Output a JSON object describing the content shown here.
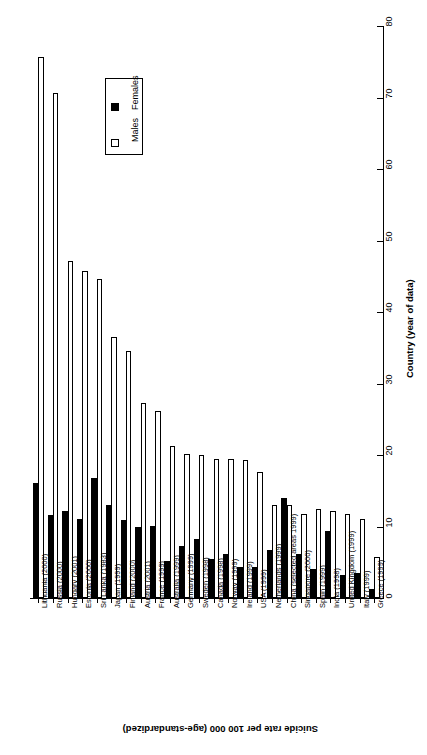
{
  "chart_data": {
    "type": "bar",
    "title": "",
    "orientation": "rotated-90",
    "xlabel": "Country (year of data)",
    "ylabel": "Suicide rate per 100 000 (age-standardized)",
    "ylim": [
      0,
      80
    ],
    "yticks": [
      0,
      10,
      20,
      30,
      40,
      50,
      60,
      70,
      80
    ],
    "grid": false,
    "legend_position": "upper-right",
    "categories": [
      "Lithuania (2000)",
      "Russia (2000)",
      "Hungary (2001)",
      "Estonia (2000)",
      "Sri Lanka (1983)",
      "Japan (1999)",
      "Finland (2000)",
      "Austria (2001)",
      "France (1999)",
      "Australia (1999)",
      "Germany (1999)",
      "Sweden (1998)",
      "Canada (1998)",
      "Norway (1999)",
      "Ireland (1999)",
      "USA (1999)",
      "Netherlands (1999)",
      "China (selected areas 1999)",
      "Singapore (2000)",
      "Spain (1999)",
      "India (1998)",
      "United Kingdom (1999)",
      "Italy (1999)",
      "Greece (1999)"
    ],
    "series": [
      {
        "name": "Females",
        "color": "#000000",
        "values": [
          16.1,
          11.6,
          12.2,
          11.0,
          16.8,
          13.0,
          10.9,
          9.9,
          10.1,
          5.2,
          7.3,
          8.3,
          5.4,
          6.1,
          4.3,
          4.4,
          6.7,
          14.0,
          6.1,
          4.0,
          9.4,
          3.2,
          3.5,
          1.3
        ],
        "marker": "filled-square"
      },
      {
        "name": "Males",
        "color": "#ffffff",
        "values": [
          75.6,
          70.6,
          47.1,
          45.8,
          44.6,
          36.5,
          34.6,
          27.3,
          26.1,
          21.2,
          20.2,
          20.0,
          19.5,
          19.5,
          19.3,
          17.6,
          13.0,
          13.0,
          11.8,
          12.5,
          12.2,
          11.8,
          11.1,
          5.7
        ],
        "marker": "open-square"
      }
    ]
  },
  "legend": {
    "entries": [
      {
        "label": "Females",
        "swatch": "filled-square"
      },
      {
        "label": "Males",
        "swatch": "open-square"
      }
    ]
  },
  "axes": {
    "value_axis_title": "Country (year of data)",
    "category_axis_title": "Suicide rate per 100 000 (age-standardized)",
    "tick_labels": [
      "0",
      "10",
      "20",
      "30",
      "40",
      "50",
      "60",
      "70",
      "80"
    ]
  }
}
